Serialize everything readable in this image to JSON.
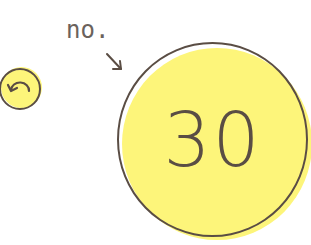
{
  "back_button": {
    "icon": "undo-arrow-icon",
    "fill_color": "#fdf57a",
    "stroke_color": "#5a4d44"
  },
  "annotation": {
    "label": "no.",
    "arrow": "arrow-down-right-icon"
  },
  "counter": {
    "value": "30",
    "fill_color": "#fdf57a",
    "stroke_color": "#5a4d44"
  }
}
